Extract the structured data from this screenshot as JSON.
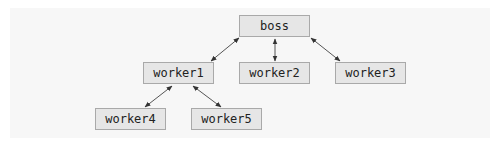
{
  "diagram": {
    "type": "tree",
    "nodes": [
      {
        "id": "boss",
        "label": "boss"
      },
      {
        "id": "worker1",
        "label": "worker1"
      },
      {
        "id": "worker2",
        "label": "worker2"
      },
      {
        "id": "worker3",
        "label": "worker3"
      },
      {
        "id": "worker4",
        "label": "worker4"
      },
      {
        "id": "worker5",
        "label": "worker5"
      }
    ],
    "edges": [
      {
        "from": "boss",
        "to": "worker1",
        "style": "bidirectional"
      },
      {
        "from": "boss",
        "to": "worker2",
        "style": "bidirectional"
      },
      {
        "from": "boss",
        "to": "worker3",
        "style": "bidirectional"
      },
      {
        "from": "worker1",
        "to": "worker4",
        "style": "bidirectional"
      },
      {
        "from": "worker1",
        "to": "worker5",
        "style": "bidirectional"
      }
    ],
    "colors": {
      "node_fill": "#e6e6e6",
      "node_border": "#a9a9a9",
      "edge": "#333333",
      "background": "#f7f7f7"
    }
  }
}
